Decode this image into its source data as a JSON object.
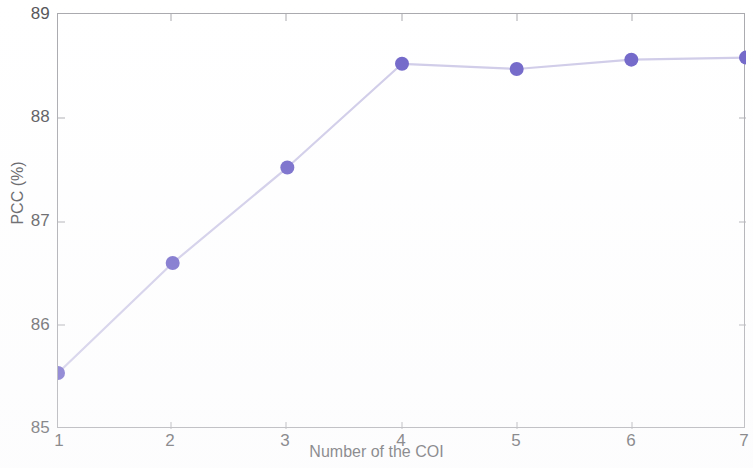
{
  "chart_data": {
    "type": "line",
    "title": "",
    "xlabel": "Number of the COI",
    "ylabel": "PCC (%)",
    "xlim": [
      1,
      7
    ],
    "ylim": [
      85,
      89
    ],
    "xticks": [
      "1",
      "2",
      "3",
      "4",
      "5",
      "6",
      "7"
    ],
    "yticks": [
      "85",
      "86",
      "87",
      "88",
      "89"
    ],
    "grid": false,
    "legend": null,
    "marker": "circle",
    "marker_color": "#6f64c8",
    "line_color": "#cfcbe8",
    "axis_color": "#a9a9ae",
    "text_color": "#56565a",
    "background_color": "#ffffff",
    "x": [
      1,
      2,
      3,
      4,
      5,
      6,
      7
    ],
    "values": [
      85.54,
      86.6,
      87.52,
      88.52,
      88.47,
      88.56,
      88.58
    ],
    "series": [
      {
        "name": "PCC",
        "x": [
          1,
          2,
          3,
          4,
          5,
          6,
          7
        ],
        "values": [
          85.54,
          86.6,
          87.52,
          88.52,
          88.47,
          88.56,
          88.58
        ]
      }
    ]
  },
  "axes": {
    "y_title": "PCC (%)",
    "x_title": "Number of the COI",
    "y_tick_labels": [
      "89",
      "88",
      "87",
      "86",
      "85"
    ],
    "x_tick_labels": [
      "1",
      "2",
      "3",
      "4",
      "5",
      "6",
      "7"
    ]
  }
}
